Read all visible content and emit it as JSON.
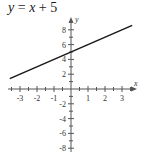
{
  "title": {
    "lhs": "y",
    "eq": " = ",
    "var": "x",
    "rest": " + 5"
  },
  "colors": {
    "line": "#1a1a1a",
    "axis": "#555555",
    "text": "#333333"
  },
  "chart_data": {
    "type": "line",
    "title": "y = x + 5",
    "xlabel": "x",
    "ylabel": "y",
    "xlim": [
      -3.6,
      3.6
    ],
    "ylim": [
      -8.5,
      9
    ],
    "x_ticks": [
      -3,
      -2,
      -1,
      1,
      2,
      3
    ],
    "x_tick_labels": [
      "-3",
      "-2",
      "-1",
      "1",
      "2",
      "3"
    ],
    "y_ticks": [
      -8,
      -6,
      -4,
      -2,
      2,
      4,
      6,
      8
    ],
    "y_tick_labels": [
      "-8",
      "-6",
      "-4",
      "-2",
      "2",
      "4",
      "6",
      "8"
    ],
    "grid": false,
    "legend": null,
    "series": [
      {
        "name": "y = x + 5",
        "x": [
          -3.6,
          3.6
        ],
        "y": [
          1.4,
          8.6
        ]
      }
    ]
  }
}
